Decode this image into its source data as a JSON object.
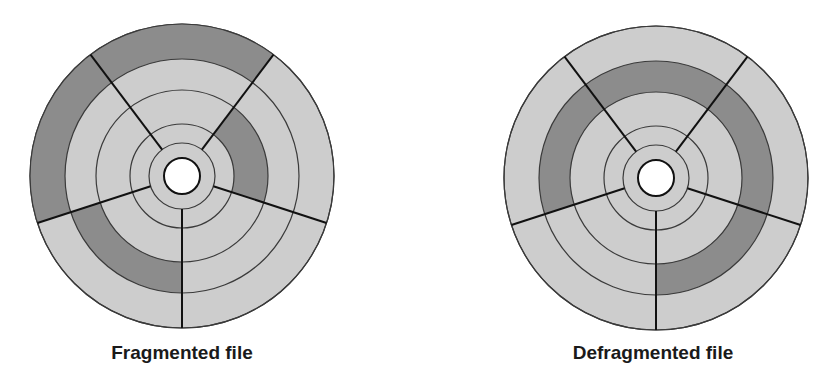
{
  "colors": {
    "light": "#cdcdcd",
    "dark": "#8c8c8c",
    "line": "#3a3a3a",
    "spoke": "#111111",
    "hole": "#ffffff"
  },
  "ring_radii": [
    152,
    117,
    86,
    52,
    33
  ],
  "hole_radius": 18,
  "spoke_angles_deg": [
    -37,
    37,
    108,
    180,
    252
  ],
  "disks": [
    {
      "id": "fragmented",
      "label": "Fragmented file",
      "cx": 182,
      "cy": 176,
      "label_x": 182,
      "label_y": 342,
      "dark_segments": [
        {
          "ring": 0,
          "from": -37,
          "to": 37
        },
        {
          "ring": 0,
          "from": 252,
          "to": 323
        },
        {
          "ring": 1,
          "from": 180,
          "to": 252
        },
        {
          "ring": 2,
          "from": 37,
          "to": 108
        }
      ]
    },
    {
      "id": "defragmented",
      "label": "Defragmented file",
      "cx": 656,
      "cy": 178,
      "label_x": 653,
      "label_y": 342,
      "dark_segments": [
        {
          "ring": 1,
          "from": 252,
          "to": 540
        }
      ]
    }
  ]
}
